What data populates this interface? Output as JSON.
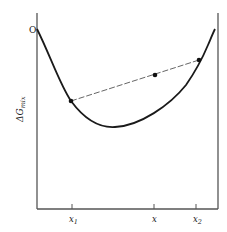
{
  "diagram": {
    "type": "free-energy-of-mixing-curve",
    "y_axis_label": "ΔG",
    "y_axis_label_subscript": "mix",
    "origin_label": "O",
    "x_ticks": [
      {
        "label": "x",
        "subscript": "1",
        "x": 72
      },
      {
        "label": "x",
        "subscript": "",
        "x": 154
      },
      {
        "label": "x",
        "subscript": "2",
        "x": 196
      }
    ],
    "points": [
      {
        "name": "left-tangent-point",
        "x": 71,
        "y": 101
      },
      {
        "name": "mixture-point",
        "x": 155,
        "y": 75
      },
      {
        "name": "right-tangent-point",
        "x": 199,
        "y": 60
      }
    ],
    "colors": {
      "line": "#1a1a1a",
      "axis": "#555555",
      "dash": "#666666"
    }
  }
}
